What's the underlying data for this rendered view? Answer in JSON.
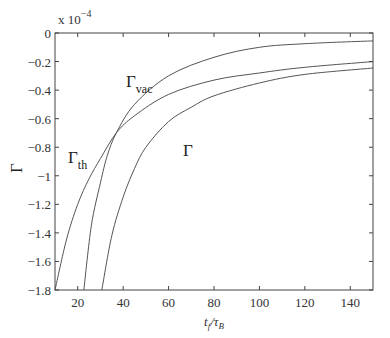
{
  "chart_data": {
    "type": "line",
    "title": "",
    "xlabel": "t_f/τ_B",
    "xlabel_main": "t",
    "xlabel_main_sub": "f",
    "xlabel_den": "τ",
    "xlabel_den_sub": "B",
    "ylabel": "Γ",
    "y_multiplier": "x 10",
    "y_multiplier_exp": "−4",
    "xlim": [
      10,
      150
    ],
    "ylim": [
      -1.8,
      0
    ],
    "grid": false,
    "legend": "none (inline annotations)",
    "x_ticks": [
      20,
      40,
      60,
      80,
      100,
      120,
      140
    ],
    "x_tick_labels": [
      "20",
      "40",
      "60",
      "80",
      "100",
      "120",
      "140"
    ],
    "y_ticks": [
      0,
      -0.2,
      -0.4,
      -0.6,
      -0.8,
      -1,
      -1.2,
      -1.4,
      -1.6,
      -1.8
    ],
    "y_tick_labels": [
      "0",
      "−0.2",
      "−0.4",
      "−0.6",
      "−0.8",
      "−1",
      "−1.2",
      "−1.4",
      "−1.6",
      "−1.8"
    ],
    "series": [
      {
        "name": "Γ_vac",
        "label": "Γ",
        "label_sub": "vac",
        "x": [
          22.7,
          26,
          30,
          33,
          37,
          45,
          60,
          80,
          100,
          120,
          150
        ],
        "values": [
          -1.8,
          -1.35,
          -1.05,
          -0.86,
          -0.7,
          -0.5,
          -0.3,
          -0.17,
          -0.1,
          -0.075,
          -0.055
        ]
      },
      {
        "name": "Γ_th",
        "label": "Γ",
        "label_sub": "th",
        "x": [
          10,
          15,
          20,
          25,
          30,
          37,
          45,
          60,
          80,
          100,
          120,
          150
        ],
        "values": [
          -1.8,
          -1.45,
          -1.2,
          -1.02,
          -0.88,
          -0.7,
          -0.58,
          -0.43,
          -0.33,
          -0.28,
          -0.24,
          -0.2
        ]
      },
      {
        "name": "Γ",
        "label": "Γ",
        "label_sub": "",
        "x": [
          30.6,
          35,
          40,
          45,
          50,
          60,
          70,
          80,
          100,
          120,
          150
        ],
        "values": [
          -1.8,
          -1.42,
          -1.15,
          -0.95,
          -0.8,
          -0.62,
          -0.52,
          -0.44,
          -0.35,
          -0.29,
          -0.245
        ]
      }
    ]
  }
}
